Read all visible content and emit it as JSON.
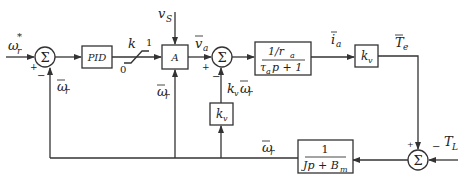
{
  "diagram": {
    "type": "control-block-diagram",
    "colors": {
      "line": "#333333",
      "background": "#ffffff",
      "text": "#222222"
    },
    "inputs": {
      "speed_reference": {
        "symbol": "ω",
        "sub": "r",
        "sup": "*"
      },
      "supply_voltage": {
        "symbol": "v",
        "sub": "S"
      },
      "load_torque": {
        "symbol": "T",
        "sub": "L"
      }
    },
    "blocks": {
      "pid": {
        "label": "PID"
      },
      "saturation": {
        "label": "k",
        "upper": "1",
        "lower": "0"
      },
      "actuator": {
        "label": "A"
      },
      "armature": {
        "numerator": "1/r",
        "numerator_sub": "a",
        "denominator_a": "τ",
        "denominator_sub": "a",
        "denominator_b": "p + 1"
      },
      "torque_gain": {
        "label": "k",
        "sub": "v"
      },
      "backemf_gain": {
        "label": "k",
        "sub": "v"
      },
      "mechanical": {
        "numerator": "1",
        "denominator_a": "Jp + B",
        "denominator_sub": "m"
      }
    },
    "summers": {
      "speed_error": {
        "glyph": "Σ",
        "signs": [
          "+",
          "−"
        ]
      },
      "voltage_sum": {
        "glyph": "Σ",
        "signs": [
          "+",
          "−"
        ]
      },
      "torque_sum": {
        "glyph": "Σ",
        "signs": [
          "+",
          "−"
        ]
      }
    },
    "signals": {
      "omega_fb_left": {
        "symbol": "ω",
        "sub": "r"
      },
      "omega_fb_mid": {
        "symbol": "ω",
        "sub": "r"
      },
      "omega_fb_bottom": {
        "symbol": "ω",
        "sub": "r"
      },
      "armature_voltage": {
        "symbol": "v",
        "sub": "a"
      },
      "back_emf": {
        "k": "k",
        "k_sub": "v",
        "symbol": "ω",
        "sub": "r"
      },
      "armature_current": {
        "symbol": "i",
        "sub": "a"
      },
      "electric_torque": {
        "symbol": "T",
        "sub": "e"
      }
    }
  }
}
